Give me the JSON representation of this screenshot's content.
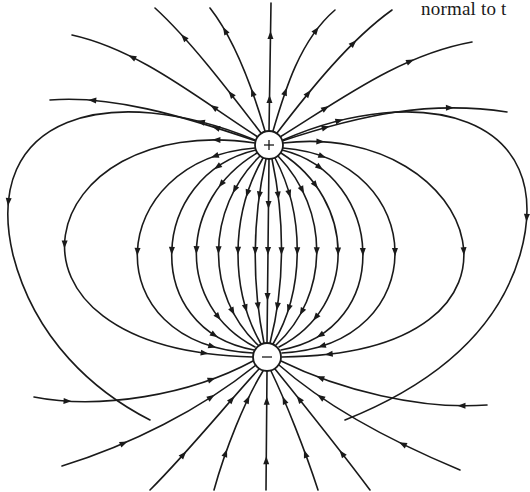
{
  "caption": {
    "text": "normal to t"
  },
  "diagram": {
    "line_color": "#1a1a1a",
    "background": "#ffffff",
    "charges": [
      {
        "id": "positive",
        "sign": "+",
        "label": "positive-charge",
        "cx": 269,
        "cy": 145,
        "r": 14
      },
      {
        "id": "negative",
        "sign": "−",
        "label": "negative-charge",
        "cx": 267,
        "cy": 357,
        "r": 14
      }
    ],
    "loops": [
      {
        "name": "loop-center",
        "d": "M269,159 L267,343",
        "arrows": [
          0.25,
          0.5,
          0.75
        ]
      },
      {
        "name": "loop-r1",
        "d": "M272,159 C285,220 285,285 270,343",
        "arrows": [
          0.2,
          0.5,
          0.8
        ]
      },
      {
        "name": "loop-l1",
        "d": "M266,159 C252,220 252,285 264,343",
        "arrows": [
          0.2,
          0.5,
          0.8
        ]
      },
      {
        "name": "loop-r2",
        "d": "M275,158 C305,215 305,290 273,344",
        "arrows": [
          0.2,
          0.5,
          0.8
        ]
      },
      {
        "name": "loop-l2",
        "d": "M263,158 C230,215 230,290 261,344",
        "arrows": [
          0.2,
          0.5,
          0.8
        ]
      },
      {
        "name": "loop-r3",
        "d": "M278,156 C330,210 330,295 276,345",
        "arrows": [
          0.2,
          0.5,
          0.8
        ]
      },
      {
        "name": "loop-l3",
        "d": "M260,156 C205,210 205,295 258,345",
        "arrows": [
          0.2,
          0.5,
          0.8
        ]
      },
      {
        "name": "loop-r4",
        "d": "M281,153 C355,200 360,305 279,347",
        "arrows": [
          0.2,
          0.5,
          0.8
        ]
      },
      {
        "name": "loop-l4",
        "d": "M257,153 C178,200 175,305 255,347",
        "arrows": [
          0.2,
          0.5,
          0.8
        ]
      },
      {
        "name": "loop-r5",
        "d": "M282,150 C385,175 395,330 281,350",
        "arrows": [
          0.15,
          0.5,
          0.85
        ]
      },
      {
        "name": "loop-l5",
        "d": "M256,150 C148,175 140,330 254,350",
        "arrows": [
          0.15,
          0.5,
          0.85
        ]
      },
      {
        "name": "loop-r6",
        "d": "M283,148 C430,160 435,345 282,353",
        "arrows": [
          0.12,
          0.5,
          0.88
        ]
      },
      {
        "name": "loop-l6",
        "d": "M255,148 C105,160 92,345 253,353",
        "arrows": [
          0.12,
          0.5,
          0.88
        ]
      },
      {
        "name": "loop-r7",
        "d": "M283,143 C480,120 565,355 282,357",
        "arrows": [
          0.08,
          0.5,
          0.9
        ]
      },
      {
        "name": "loop-l7",
        "d": "M255,143 C35,110 -30,350 253,357",
        "arrows": [
          0.08,
          0.5,
          0.9
        ]
      },
      {
        "name": "loop-r8",
        "d": "M283,140 C420,80 560,115 520,255 C495,340 420,390 345,420",
        "arrows": [
          0.1,
          0.52
        ]
      },
      {
        "name": "loop-l8",
        "d": "M255,140 C110,80 -20,115 13,255 C35,340 95,392 150,420",
        "arrows": [
          0.1,
          0.52
        ]
      }
    ],
    "open_lines_positive": [
      {
        "name": "out-top",
        "d": "M269,131 L271,3",
        "arrows": [
          0.25,
          0.75
        ]
      },
      {
        "name": "out-tr1",
        "d": "M273,131 C285,90 300,40 335,10",
        "arrows": [
          0.3,
          0.8
        ]
      },
      {
        "name": "out-tr2",
        "d": "M277,133 C310,90 350,40 392,10",
        "arrows": [
          0.3,
          0.7
        ]
      },
      {
        "name": "out-tr3",
        "d": "M280,137 C340,100 400,55 472,42",
        "arrows": [
          0.25,
          0.7
        ]
      },
      {
        "name": "out-tr4",
        "d": "M282,141 C360,115 430,100 507,112",
        "arrows": [
          0.2,
          0.75
        ]
      },
      {
        "name": "out-tl1",
        "d": "M265,131 C253,90 235,40 210,8",
        "arrows": [
          0.3,
          0.8
        ]
      },
      {
        "name": "out-tl2",
        "d": "M261,133 C228,90 190,40 155,8",
        "arrows": [
          0.3,
          0.75
        ]
      },
      {
        "name": "out-tl3",
        "d": "M258,137 C200,100 140,50 72,35",
        "arrows": [
          0.25,
          0.7
        ]
      },
      {
        "name": "out-tl4",
        "d": "M256,141 C180,115 110,95 50,100",
        "arrows": [
          0.2,
          0.8
        ]
      }
    ],
    "open_lines_negative": [
      {
        "name": "in-bottom",
        "d": "M266,490 L267,371",
        "arrows": [
          0.25,
          0.75
        ]
      },
      {
        "name": "in-br1",
        "d": "M318,490 C305,450 285,400 271,371",
        "arrows": [
          0.3,
          0.75
        ]
      },
      {
        "name": "in-br2",
        "d": "M370,490 C340,450 300,400 275,369",
        "arrows": [
          0.3,
          0.75
        ]
      },
      {
        "name": "in-br3",
        "d": "M460,470 C400,445 330,410 279,365",
        "arrows": [
          0.3,
          0.75
        ]
      },
      {
        "name": "in-br4",
        "d": "M487,405 C420,410 340,390 281,361",
        "arrows": [
          0.12,
          0.8
        ]
      },
      {
        "name": "in-bl1",
        "d": "M214,490 C225,450 245,400 263,371",
        "arrows": [
          0.3,
          0.75
        ]
      },
      {
        "name": "in-bl2",
        "d": "M150,490 C190,450 230,400 259,369",
        "arrows": [
          0.3,
          0.75
        ]
      },
      {
        "name": "in-bl3",
        "d": "M62,466 C130,445 200,410 256,365",
        "arrows": [
          0.3,
          0.75
        ]
      },
      {
        "name": "in-bl4",
        "d": "M34,397 C100,410 190,395 253,361",
        "arrows": [
          0.15,
          0.8
        ]
      }
    ]
  }
}
